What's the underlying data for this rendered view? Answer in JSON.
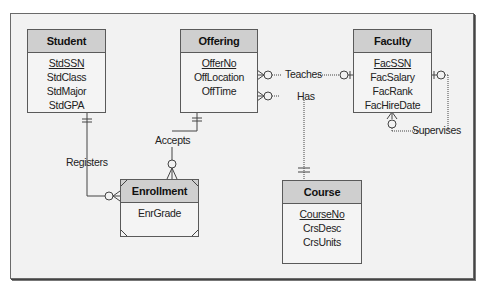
{
  "diagram": {
    "type": "Entity Relationship Diagram (Crow's Foot)",
    "entities": [
      {
        "name": "Student",
        "attributes": [
          "StdSSN",
          "StdClass",
          "StdMajor",
          "StdGPA"
        ],
        "primary_key": "StdSSN"
      },
      {
        "name": "Offering",
        "attributes": [
          "OfferNo",
          "OffLocation",
          "OffTime"
        ],
        "primary_key": "OfferNo"
      },
      {
        "name": "Faculty",
        "attributes": [
          "FacSSN",
          "FacSalary",
          "FacRank",
          "FacHireDate"
        ],
        "primary_key": "FacSSN"
      },
      {
        "name": "Enrollment",
        "attributes": [
          "EnrGrade"
        ],
        "primary_key": null,
        "weak": true
      },
      {
        "name": "Course",
        "attributes": [
          "CourseNo",
          "CrsDesc",
          "CrsUnits"
        ],
        "primary_key": "CourseNo"
      }
    ],
    "relationships": [
      {
        "name": "Registers",
        "from": "Student",
        "to": "Enrollment",
        "from_card": "exactly-one",
        "to_card": "zero-or-many",
        "identifying": true
      },
      {
        "name": "Accepts",
        "from": "Offering",
        "to": "Enrollment",
        "from_card": "exactly-one",
        "to_card": "zero-or-many",
        "identifying": true
      },
      {
        "name": "Teaches",
        "from": "Faculty",
        "to": "Offering",
        "from_card": "zero-or-one",
        "to_card": "zero-or-many",
        "identifying": false
      },
      {
        "name": "Has",
        "from": "Course",
        "to": "Offering",
        "from_card": "exactly-one",
        "to_card": "zero-or-many",
        "identifying": false
      },
      {
        "name": "Supervises",
        "from": "Faculty",
        "to": "Faculty",
        "from_card": "zero-or-one",
        "to_card": "zero-or-many",
        "identifying": false
      }
    ]
  },
  "labels": {
    "student": {
      "title": "Student",
      "a0": "StdSSN",
      "a1": "StdClass",
      "a2": "StdMajor",
      "a3": "StdGPA"
    },
    "offering": {
      "title": "Offering",
      "a0": "OfferNo",
      "a1": "OffLocation",
      "a2": "OffTime"
    },
    "faculty": {
      "title": "Faculty",
      "a0": "FacSSN",
      "a1": "FacSalary",
      "a2": "FacRank",
      "a3": "FacHireDate"
    },
    "enrollment": {
      "title": "Enrollment",
      "a0": "EnrGrade"
    },
    "course": {
      "title": "Course",
      "a0": "CourseNo",
      "a1": "CrsDesc",
      "a2": "CrsUnits"
    },
    "rel": {
      "registers": "Registers",
      "accepts": "Accepts",
      "teaches": "Teaches",
      "has": "Has",
      "supervises": "Supervises"
    }
  },
  "colors": {
    "header_fill": "#cfcfcf",
    "body_fill": "#f4f4f4",
    "canvas": "#f2f2f2",
    "line": "#444444"
  }
}
